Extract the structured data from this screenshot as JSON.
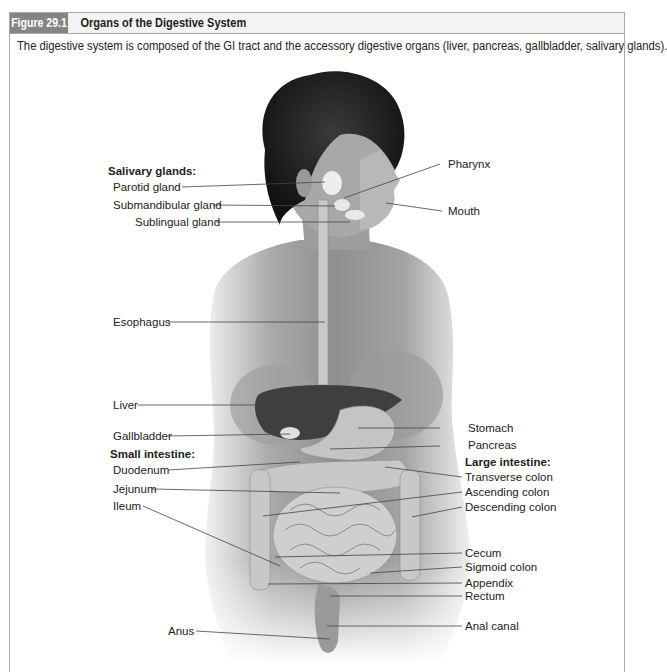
{
  "figure": {
    "number": "Figure 29.1",
    "title": "Organs of the Digestive System",
    "caption": "The digestive system is composed of the GI tract and the accessory digestive organs (liver, pancreas, gallbladder, salivary glands)."
  },
  "labels": {
    "salivary_heading": "Salivary glands:",
    "parotid": "Parotid gland",
    "submandibular": "Submandibular gland",
    "sublingual": "Sublingual gland",
    "pharynx": "Pharynx",
    "mouth": "Mouth",
    "esophagus": "Esophagus",
    "liver": "Liver",
    "gallbladder": "Gallbladder",
    "small_intestine_heading": "Small intestine:",
    "duodenum": "Duodenum",
    "jejunum": "Jejunum",
    "ileum": "Ileum",
    "stomach": "Stomach",
    "pancreas": "Pancreas",
    "large_intestine_heading": "Large intestine:",
    "transverse_colon": "Transverse colon",
    "ascending_colon": "Ascending colon",
    "descending_colon": "Descending colon",
    "cecum": "Cecum",
    "sigmoid_colon": "Sigmoid colon",
    "appendix": "Appendix",
    "rectum": "Rectum",
    "anal_canal": "Anal canal",
    "anus": "Anus"
  },
  "colors": {
    "frame_border": "#a8a8a8",
    "figure_number_bg": "#858585",
    "header_bg": "#f3f3f3"
  }
}
